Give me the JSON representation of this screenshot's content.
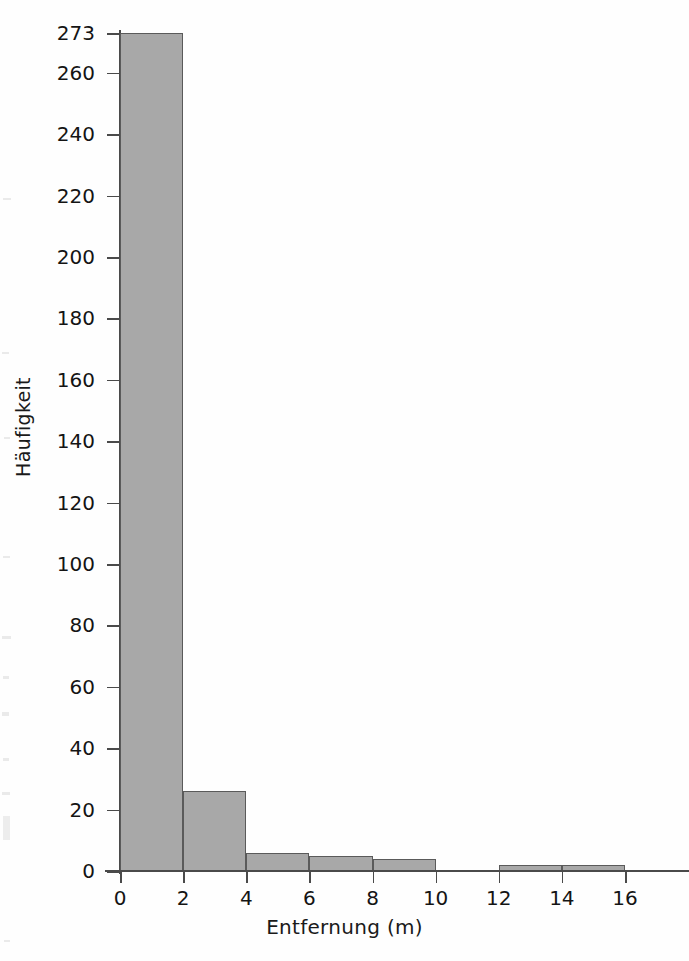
{
  "chart_data": {
    "type": "bar",
    "title": "",
    "subtitle": "",
    "xlabel": "Entfernung (m)",
    "ylabel": "Häufigkeit",
    "grid": false,
    "legend": null,
    "bin_width": 2,
    "categories": [
      "0–2",
      "2–4",
      "4–6",
      "6–8",
      "8–10",
      "10–12",
      "12–14",
      "14–16"
    ],
    "bin_edges": [
      0,
      2,
      4,
      6,
      8,
      10,
      12,
      14,
      16
    ],
    "values": [
      273,
      26,
      6,
      5,
      4,
      0,
      2,
      2
    ],
    "xlim": [
      0,
      16
    ],
    "ylim": [
      0,
      273
    ],
    "xticks": [
      0,
      2,
      4,
      6,
      8,
      10,
      12,
      14,
      16
    ],
    "xtick_labels": [
      "0",
      "2",
      "4",
      "6",
      "8",
      "10",
      "12",
      "14",
      "16"
    ],
    "yticks": [
      0,
      20,
      40,
      60,
      80,
      100,
      120,
      140,
      160,
      180,
      200,
      220,
      240,
      260,
      273
    ],
    "ytick_labels": [
      "0",
      "20",
      "40",
      "60",
      "80",
      "100",
      "120",
      "140",
      "160",
      "180",
      "200",
      "220",
      "240",
      "260",
      "273"
    ],
    "colors": {
      "bar_fill": "#a8a8a8",
      "bar_edge": "#5a5a5a",
      "axis": "#4a4a4a",
      "text": "#141414",
      "background": "#fefefe"
    }
  }
}
